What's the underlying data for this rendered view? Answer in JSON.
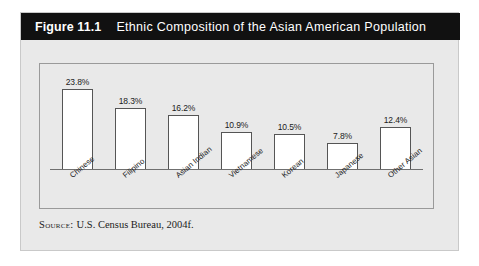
{
  "figure": {
    "number_label": "Figure 11.1",
    "title": "Ethnic Composition of the Asian American Population",
    "source_label": "Source:",
    "source_text": "U.S. Census Bureau, 2004f."
  },
  "colors": {
    "title_bar_bg": "#111111",
    "title_bar_text": "#ffffff",
    "panel_bg": "#e9e9e9",
    "bar_fill": "#ffffff",
    "bar_border": "#555555",
    "axis_line": "#6f6f6f",
    "plot_border": "#9a9a9a"
  },
  "chart_data": {
    "type": "bar",
    "title": "Ethnic Composition of the Asian American Population",
    "xlabel": "",
    "ylabel": "",
    "ylim": [
      0,
      25
    ],
    "grid": false,
    "legend": false,
    "categories": [
      "Chinese",
      "Filipino",
      "Asian Indian",
      "Vietnamese",
      "Korean",
      "Japanese",
      "Other Asian"
    ],
    "values": [
      23.8,
      18.3,
      16.2,
      10.9,
      10.5,
      7.8,
      12.4
    ],
    "value_labels": [
      "23.8%",
      "18.3%",
      "16.2%",
      "10.9%",
      "10.5%",
      "7.8%",
      "12.4%"
    ]
  }
}
